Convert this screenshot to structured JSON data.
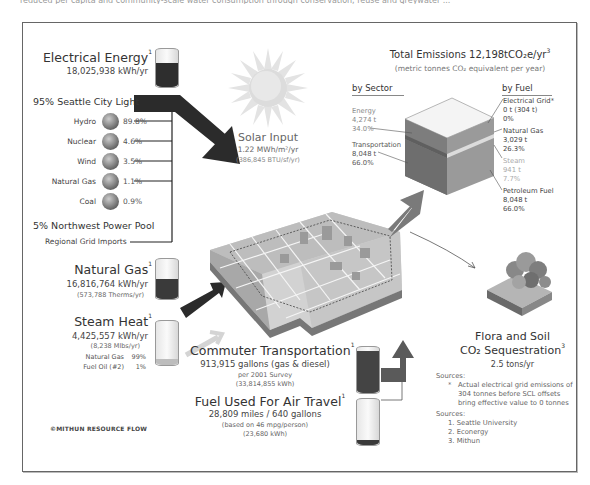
{
  "header": {
    "cut_text": "reduced per capita and community-scale water consumption through conservation, reuse and greywater ..."
  },
  "electrical_energy": {
    "title": "Electrical Energy",
    "footnote": "1",
    "value": "18,025,938 kWh/yr"
  },
  "seattle_city_light": {
    "title": "95% Seattle City Light",
    "sources": [
      {
        "name": "Hydro",
        "pct": "89.8%"
      },
      {
        "name": "Nuclear",
        "pct": "4.6%"
      },
      {
        "name": "Wind",
        "pct": "3.5%"
      },
      {
        "name": "Natural Gas",
        "pct": "1.1%"
      },
      {
        "name": "Coal",
        "pct": "0.9%"
      }
    ]
  },
  "power_pool": {
    "title": "5% Northwest Power Pool",
    "subtitle": "Regional Grid Imports"
  },
  "solar": {
    "title": "Solar Input",
    "value": "1.22 MWh/m²/yr",
    "sub": "(386,845 BTU/sf/yr)"
  },
  "natural_gas": {
    "title": "Natural Gas",
    "footnote": "1",
    "value": "16,816,764 kWh/yr",
    "sub": "(573,788 Therms/yr)"
  },
  "steam_heat": {
    "title": "Steam Heat",
    "footnote": "1",
    "value": "4,425,557 kWh/yr",
    "sub": "(8,238 Mlbs/yr)",
    "mix": [
      {
        "name": "Natural Gas",
        "pct": "99%"
      },
      {
        "name": "Fuel Oil (#2)",
        "pct": "1%"
      }
    ]
  },
  "commuter": {
    "title": "Commuter Transportation",
    "footnote": "1",
    "value": "913,915 gallons (gas & diesel)",
    "sub1": "per 2001 Survey",
    "sub2": "(33,814,855 kWh)"
  },
  "air_travel": {
    "title": "Fuel Used For Air Travel",
    "footnote": "1",
    "value": "28,809 miles / 640 gallons",
    "sub1": "(based on 46 mpg/person)",
    "sub2": "(23,680 kWh)"
  },
  "emissions": {
    "title": "Total Emissions 12,198tCO₂e/yr",
    "footnote": "3",
    "subtitle": "(metric tonnes CO₂ equivalent per year)",
    "by_sector_label": "by Sector",
    "by_fuel_label": "by Fuel",
    "sectors": [
      {
        "name": "Energy",
        "value": "4,274 t",
        "pct": "34.0%"
      },
      {
        "name": "Transportation",
        "value": "8,048 t",
        "pct": "66.0%"
      }
    ],
    "fuels": [
      {
        "name": "Electrical Grid*",
        "value": "0 t (304 t)",
        "pct": "0%"
      },
      {
        "name": "Natural Gas",
        "value": "3,029 t",
        "pct": "26.3%"
      },
      {
        "name": "Steam",
        "value": "941 t",
        "pct": "7.7%"
      },
      {
        "name": "Petroleum Fuel",
        "value": "8,048 t",
        "pct": "66.0%"
      }
    ]
  },
  "sequestration": {
    "title_line1": "Flora and Soil",
    "title_line2": "CO₂ Sequestration",
    "footnote": "3",
    "value": "2.5 tons/yr"
  },
  "notes": {
    "label": "Sources:",
    "asterisk": "*",
    "text_lines": [
      "Actual electrical grid emissions of",
      "304 tonnes before SCL offsets",
      "bring effective value to 0 tonnes"
    ]
  },
  "sources": {
    "label": "Sources:",
    "items": [
      "1. Seattle University",
      "2. Econergy",
      "3. Mithun"
    ]
  },
  "credit": "©MITHUN RESOURCE FLOW",
  "colors": {
    "dark_arrow": "#2b2b2b",
    "mid_arrow": "#6f6f6f",
    "light_arrow": "#cfcfcf",
    "frame": "#666666"
  }
}
